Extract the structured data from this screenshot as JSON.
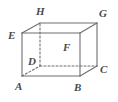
{
  "figure": {
    "name": "labelled-cuboid",
    "type": "diagram",
    "style": {
      "background_color": "#ffffff",
      "edge_color": "#6e6e6e",
      "hidden_edge_color": "#6e6e6e",
      "label_color": "#4a4a4a",
      "edge_width": 1.1,
      "hidden_edge_dash": "2 2"
    },
    "vertices": [
      {
        "id": "A",
        "label": "A",
        "x": 22,
        "y": 76,
        "hidden": false,
        "label_x": 15,
        "label_y": 81
      },
      {
        "id": "B",
        "label": "B",
        "x": 80,
        "y": 76,
        "hidden": false,
        "label_x": 74,
        "label_y": 82
      },
      {
        "id": "C",
        "label": "C",
        "x": 97,
        "y": 66,
        "hidden": false,
        "label_x": 100,
        "label_y": 64
      },
      {
        "id": "D",
        "label": "D",
        "x": 40,
        "y": 66,
        "hidden": true,
        "label_x": 28,
        "label_y": 56
      },
      {
        "id": "E",
        "label": "E",
        "x": 22,
        "y": 33,
        "hidden": false,
        "label_x": 8,
        "label_y": 30
      },
      {
        "id": "F",
        "label": "F",
        "x": 80,
        "y": 33,
        "hidden": false,
        "label_x": 63,
        "label_y": 42
      },
      {
        "id": "G",
        "label": "G",
        "x": 97,
        "y": 23,
        "hidden": false,
        "label_x": 99,
        "label_y": 8
      },
      {
        "id": "H",
        "label": "H",
        "x": 40,
        "y": 23,
        "hidden": true,
        "label_x": 36,
        "label_y": 6
      }
    ],
    "edges": [
      {
        "from": "A",
        "to": "B",
        "hidden": false,
        "name": "edge-AB"
      },
      {
        "from": "B",
        "to": "F",
        "hidden": false,
        "name": "edge-BF"
      },
      {
        "from": "F",
        "to": "E",
        "hidden": false,
        "name": "edge-FE"
      },
      {
        "from": "E",
        "to": "A",
        "hidden": false,
        "name": "edge-EA"
      },
      {
        "from": "E",
        "to": "H",
        "hidden": false,
        "name": "edge-EH"
      },
      {
        "from": "F",
        "to": "G",
        "hidden": false,
        "name": "edge-FG"
      },
      {
        "from": "B",
        "to": "C",
        "hidden": false,
        "name": "edge-BC"
      },
      {
        "from": "H",
        "to": "G",
        "hidden": false,
        "name": "edge-HG"
      },
      {
        "from": "G",
        "to": "C",
        "hidden": false,
        "name": "edge-GC"
      },
      {
        "from": "A",
        "to": "D",
        "hidden": true,
        "name": "edge-AD"
      },
      {
        "from": "D",
        "to": "C",
        "hidden": true,
        "name": "edge-DC"
      },
      {
        "from": "D",
        "to": "H",
        "hidden": true,
        "name": "edge-DH"
      }
    ]
  }
}
